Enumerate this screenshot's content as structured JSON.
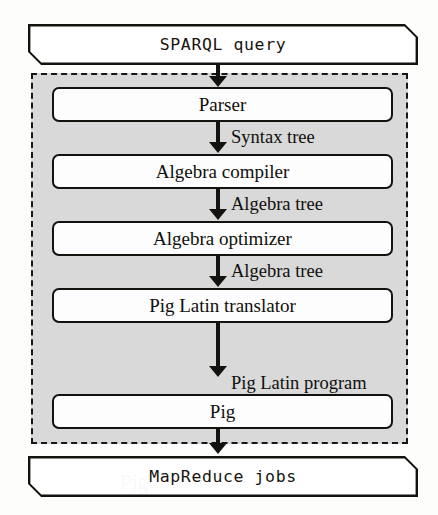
{
  "diagram": {
    "input_banner": {
      "label": "SPARQL query",
      "name": "sparql-query-banner"
    },
    "output_banner": {
      "label": "MapReduce jobs",
      "name": "mapreduce-jobs-banner"
    },
    "panel": {
      "name": "system-boundary-panel",
      "fill_color": "#d9d9d9",
      "border_style": "dashed",
      "border_color": "#171717"
    },
    "stages": [
      {
        "label": "Parser"
      },
      {
        "label": "Algebra compiler"
      },
      {
        "label": "Algebra optimizer"
      },
      {
        "label": "Pig Latin translator"
      },
      {
        "label": "Pig"
      }
    ],
    "edge_labels": [
      {
        "label": "Syntax tree"
      },
      {
        "label": "Algebra tree"
      },
      {
        "label": "Algebra tree"
      },
      {
        "label": "Pig Latin program"
      }
    ],
    "ghost_text": [
      {
        "label": "Algebra compiler"
      },
      {
        "label": "Pig"
      }
    ]
  }
}
